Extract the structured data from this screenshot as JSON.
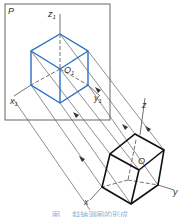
{
  "figure": {
    "plane_label": "P",
    "projection_axes": {
      "z": "z",
      "z_sub": "1",
      "x": "x",
      "x_sub": "1",
      "y": "y",
      "y_sub": "1",
      "origin": "O",
      "origin_sub": "1"
    },
    "object_axes": {
      "z": "z",
      "x": "x",
      "y": "y",
      "origin": "O"
    },
    "colors": {
      "projection_cube": "#2a6fc4",
      "object_cube": "#111111",
      "lines": "#333333",
      "caption": "#7fb6e0"
    },
    "caption": "图 … 斜轴测图的形成"
  }
}
